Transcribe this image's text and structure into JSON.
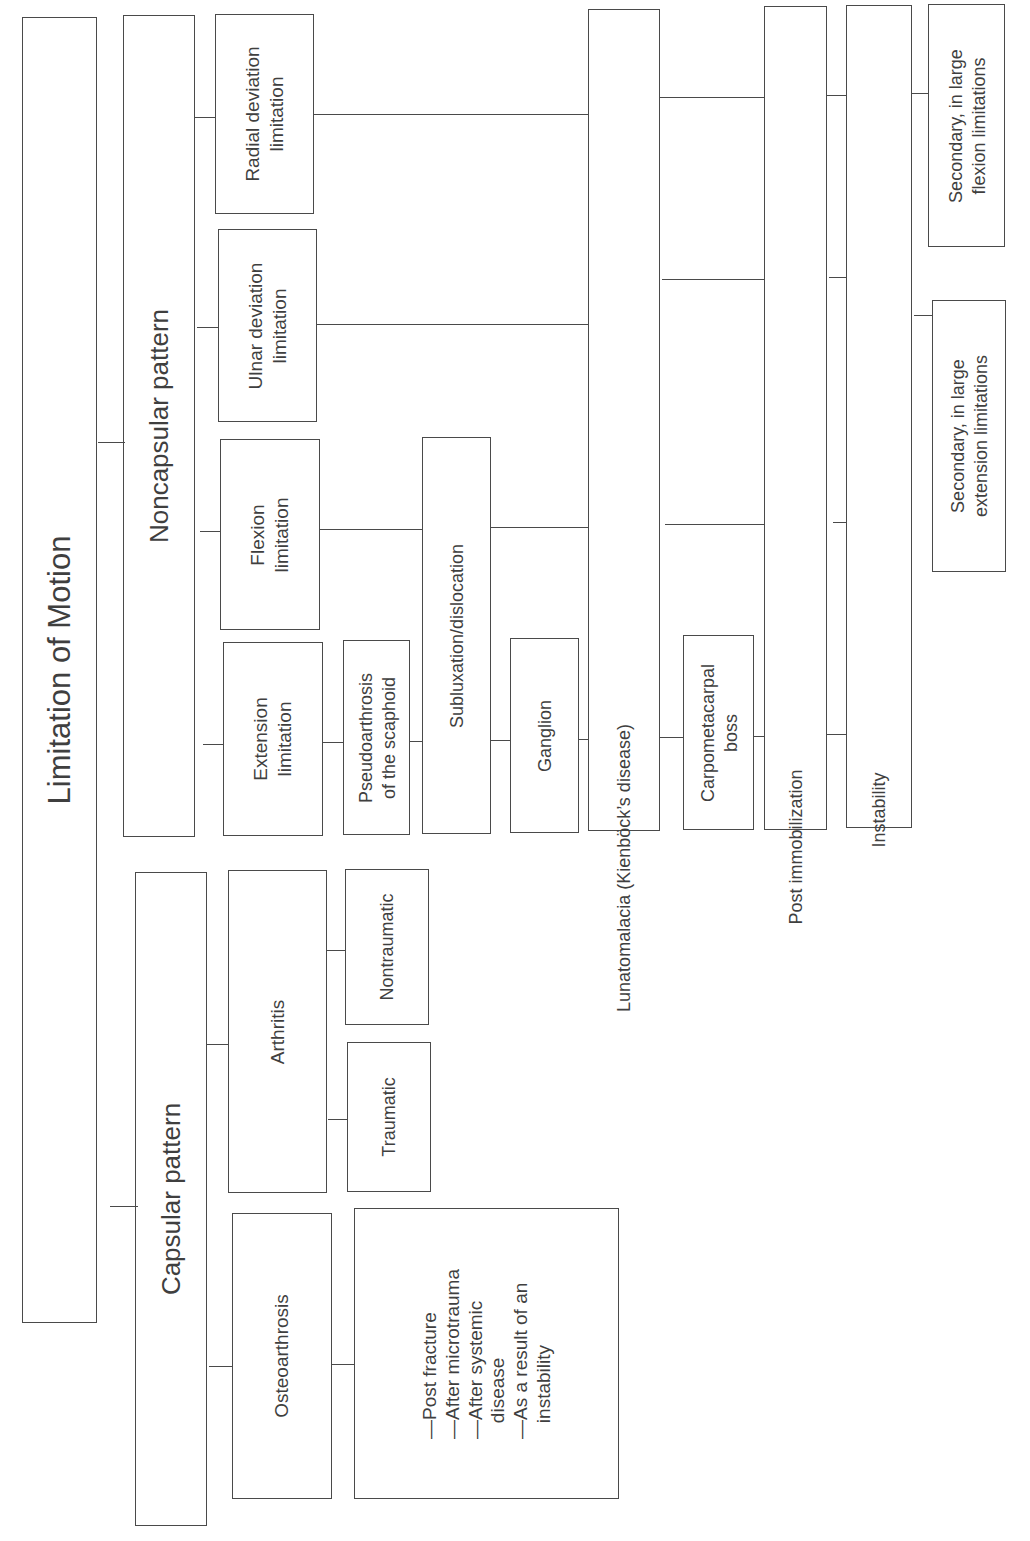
{
  "diagram": {
    "orientation": "rotated-90-ccw",
    "root": {
      "label": "Limitation of Motion"
    },
    "capsular": {
      "label": "Capsular pattern",
      "osteoarthrosis": {
        "label": "Osteoarthrosis",
        "causes": "—Post fracture\n—After microtrauma\n—After systemic\n   disease\n—As a result of an\n   instability"
      },
      "arthritis": {
        "label": "Arthritis",
        "traumatic": "Traumatic",
        "nontraumatic": "Nontraumatic"
      }
    },
    "noncapsular": {
      "label": "Noncapsular pattern",
      "limitations": {
        "extension": "Extension\nlimitation",
        "flexion": "Flexion\nlimitation",
        "ulnar": "Ulnar deviation\nlimitation",
        "radial": "Radial deviation\nlimitation"
      },
      "causes": {
        "pseudoarthrosis": "Pseudoarthrosis\nof the scaphoid",
        "subluxation": "Subluxation/dislocation",
        "ganglion": "Ganglion",
        "lunatomalacia": "Lunatomalacia (Kienböck’s disease)",
        "carpometacarpal": "Carpometacarpal\nboss",
        "post_immobilization": "Post immobilization",
        "instability": "Instability"
      },
      "instability_subtypes": {
        "extension": "Secondary, in large\nextension limitations",
        "flexion": "Secondary, in large\nflexion limitations"
      }
    }
  }
}
